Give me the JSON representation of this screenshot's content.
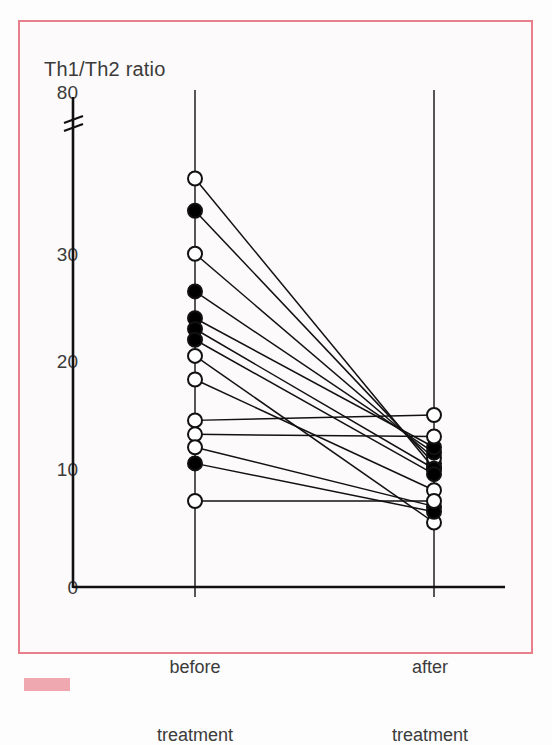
{
  "figure": {
    "frame_color": "#e8808c",
    "background": "#fcfafa",
    "line_color": "#111111",
    "marker_open_fill": "#ffffff",
    "marker_filled_fill": "#000000"
  },
  "axis": {
    "y_title": "Th1/Th2 ratio",
    "y_ticks": [
      "80",
      "30",
      "20",
      "10",
      "0"
    ],
    "y_tick_values": [
      80,
      30,
      20,
      10,
      0
    ],
    "y_break_present": true,
    "x_ticks": [
      "before\ntreatment",
      "after\ntreatment"
    ],
    "x_tick_labels": [
      {
        "line1": "before",
        "line2": "treatment"
      },
      {
        "line1": "after",
        "line2": "treatment"
      }
    ]
  },
  "chart_data": {
    "type": "line",
    "title": "",
    "subtitle": "",
    "xlabel": "",
    "ylabel": "Th1/Th2 ratio",
    "categories": [
      "before treatment",
      "after treatment"
    ],
    "ylim": [
      0,
      80
    ],
    "y_axis_break": {
      "between": [
        38,
        80
      ],
      "note": "axis break drawn below the 80 label"
    },
    "grid": false,
    "legend": "none",
    "series_note": "Paired before/after measurements; each line connects one subject. Open circles and filled circles denote two subject groups.",
    "series": [
      {
        "name": "subject-1",
        "marker": "open",
        "values": [
          38.0,
          11.0
        ]
      },
      {
        "name": "subject-2",
        "marker": "filled",
        "values": [
          35.0,
          11.5
        ]
      },
      {
        "name": "subject-3",
        "marker": "open",
        "values": [
          31.0,
          12.0
        ]
      },
      {
        "name": "subject-4",
        "marker": "filled",
        "values": [
          27.5,
          12.5
        ]
      },
      {
        "name": "subject-5",
        "marker": "filled",
        "values": [
          25.0,
          13.0
        ]
      },
      {
        "name": "subject-6",
        "marker": "filled",
        "values": [
          24.0,
          11.0
        ]
      },
      {
        "name": "subject-7",
        "marker": "filled",
        "values": [
          23.0,
          10.5
        ]
      },
      {
        "name": "subject-8",
        "marker": "open",
        "values": [
          21.5,
          6.0
        ]
      },
      {
        "name": "subject-9",
        "marker": "open",
        "values": [
          19.3,
          9.0
        ]
      },
      {
        "name": "subject-10",
        "marker": "open",
        "values": [
          15.5,
          16.0
        ]
      },
      {
        "name": "subject-11",
        "marker": "open",
        "values": [
          14.2,
          14.0
        ]
      },
      {
        "name": "subject-12",
        "marker": "open",
        "values": [
          13.0,
          7.5
        ]
      },
      {
        "name": "subject-13",
        "marker": "filled",
        "values": [
          11.5,
          7.0
        ]
      },
      {
        "name": "subject-14",
        "marker": "open",
        "values": [
          8.0,
          8.0
        ]
      }
    ]
  }
}
